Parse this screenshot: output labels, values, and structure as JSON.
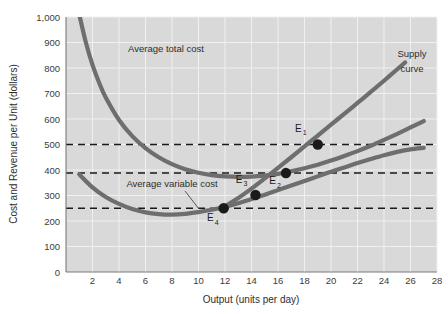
{
  "chart_data": {
    "type": "line",
    "title": "",
    "xlabel": "Output (units per day)",
    "ylabel": "Cost and Revenue per Unit (dollars)",
    "xlim": [
      0,
      28
    ],
    "ylim": [
      0,
      1000
    ],
    "grid": true,
    "legend_position": "inline-annotations",
    "xticks": [
      2,
      4,
      6,
      8,
      10,
      12,
      14,
      16,
      18,
      20,
      22,
      24,
      26,
      28
    ],
    "xticklabels": [
      "2",
      "4",
      "6",
      "8",
      "10",
      "12",
      "14",
      "16",
      "18",
      "20",
      "22",
      "24",
      "26",
      "28"
    ],
    "yticks": [
      0,
      100,
      200,
      300,
      400,
      500,
      600,
      700,
      800,
      900,
      1000
    ],
    "yticklabels": [
      "0",
      "100",
      "200",
      "300",
      "400",
      "500",
      "600",
      "700",
      "800",
      "900",
      "1,000"
    ],
    "series": [
      {
        "name": "Average total cost",
        "label": "Average total cost",
        "color": "#6e6e6e",
        "points": [
          [
            1.0,
            1010
          ],
          [
            1.5,
            900
          ],
          [
            2.0,
            812
          ],
          [
            2.5,
            742
          ],
          [
            3.0,
            684
          ],
          [
            4.0,
            596
          ],
          [
            5.0,
            533
          ],
          [
            6.0,
            486
          ],
          [
            7.0,
            450
          ],
          [
            8.0,
            423
          ],
          [
            9.0,
            403
          ],
          [
            10.0,
            389
          ],
          [
            11.0,
            380
          ],
          [
            12.0,
            375
          ],
          [
            13.0,
            373
          ],
          [
            14.0,
            374
          ],
          [
            15.0,
            378
          ],
          [
            16.0,
            385
          ],
          [
            17.0,
            395
          ],
          [
            18.0,
            407
          ],
          [
            19.0,
            421
          ],
          [
            20.0,
            437
          ],
          [
            21.0,
            455
          ],
          [
            22.0,
            474
          ],
          [
            23.0,
            495
          ],
          [
            24.0,
            518
          ],
          [
            25.0,
            542
          ],
          [
            26.0,
            567
          ],
          [
            27.0,
            592
          ]
        ]
      },
      {
        "name": "Average variable cost",
        "label": "Average variable cost",
        "color": "#6e6e6e",
        "points": [
          [
            1.0,
            383
          ],
          [
            2.0,
            332
          ],
          [
            3.0,
            294
          ],
          [
            4.0,
            267
          ],
          [
            5.0,
            247
          ],
          [
            6.0,
            234
          ],
          [
            7.0,
            227
          ],
          [
            8.0,
            225
          ],
          [
            9.0,
            228
          ],
          [
            10.0,
            235
          ],
          [
            11.0,
            244
          ],
          [
            12.0,
            256
          ],
          [
            13.0,
            270
          ],
          [
            14.0,
            286
          ],
          [
            15.0,
            303
          ],
          [
            16.0,
            321
          ],
          [
            17.0,
            339
          ],
          [
            18.0,
            357
          ],
          [
            19.0,
            375
          ],
          [
            20.0,
            393
          ],
          [
            21.0,
            410
          ],
          [
            22.0,
            427
          ],
          [
            23.0,
            443
          ],
          [
            24.0,
            458
          ],
          [
            25.0,
            471
          ],
          [
            26.0,
            481
          ],
          [
            27.0,
            487
          ]
        ]
      },
      {
        "name": "Supply curve",
        "label": "Supply curve",
        "color": "#6e6e6e",
        "points": [
          [
            11.6,
            248
          ],
          [
            12.0,
            258
          ],
          [
            13.0,
            290
          ],
          [
            14.0,
            327
          ],
          [
            15.0,
            367
          ],
          [
            16.0,
            408
          ],
          [
            17.0,
            450
          ],
          [
            18.0,
            493
          ],
          [
            19.0,
            535
          ],
          [
            20.0,
            578
          ],
          [
            21.0,
            620
          ],
          [
            22.0,
            663
          ],
          [
            23.0,
            706
          ],
          [
            24.0,
            750
          ],
          [
            25.0,
            795
          ],
          [
            25.6,
            822
          ]
        ]
      }
    ],
    "price_lines": [
      {
        "name": "price-line-500",
        "value": 500,
        "style": "dashed"
      },
      {
        "name": "price-line-390",
        "value": 388,
        "style": "dashed"
      },
      {
        "name": "price-line-250",
        "value": 250,
        "style": "dashed"
      }
    ],
    "annotated_points": [
      {
        "id": "E1",
        "label": "E",
        "subscript": "1",
        "x": 19.0,
        "y": 500,
        "label_dx": -9,
        "label_dy": -10
      },
      {
        "id": "E2",
        "label": "E",
        "subscript": "2",
        "x": 16.6,
        "y": 388,
        "label_dx": -3,
        "label_dy": 14
      },
      {
        "id": "E3",
        "label": "E",
        "subscript": "3",
        "x": 14.3,
        "y": 302,
        "label_dx": -6,
        "label_dy": -9
      },
      {
        "id": "E4",
        "label": "E",
        "subscript": "4",
        "x": 11.9,
        "y": 250,
        "label_dx": -3,
        "label_dy": 16
      }
    ],
    "annotations": [
      {
        "name": "atc-curve-label",
        "text": "Average total cost",
        "x": 166,
        "y": 52
      },
      {
        "name": "supply-curve-label-line1",
        "text": "Supply",
        "x": 412,
        "y": 57
      },
      {
        "name": "supply-curve-label-line2",
        "text": "curve",
        "x": 412,
        "y": 72
      },
      {
        "name": "avc-curve-label",
        "text": "Average variable cost",
        "x": 172,
        "y": 187
      }
    ],
    "colors": {
      "plot_background": "#d9d9d9",
      "gridline": "#f0f0f0",
      "curve": "#6e6e6e",
      "dashed_line": "#1a1a1a",
      "point_marker": "#1a1a1a",
      "axis": "#7a7a7a",
      "text": "#2e2e2e"
    }
  }
}
